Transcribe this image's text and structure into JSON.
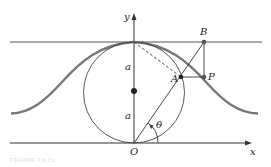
{
  "figure": {
    "caption": "FIGURE 10.1x",
    "labels": {
      "y_axis": "y",
      "x_axis": "x",
      "origin": "O",
      "point_a": "A",
      "point_b": "B",
      "point_p": "P",
      "radius_upper": "a",
      "radius_lower": "a",
      "angle": "θ"
    },
    "curve": "Witch of Agnesi",
    "colors": {
      "curve": "#777777",
      "lines": "#333333"
    }
  }
}
